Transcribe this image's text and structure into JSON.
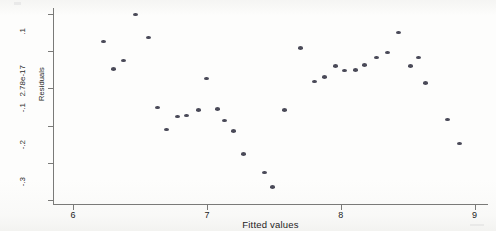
{
  "chart_data": {
    "type": "scatter",
    "title": "",
    "xlabel": "Fitted values",
    "ylabel": "Residuals",
    "xlim": [
      5.85,
      9.1
    ],
    "ylim": [
      -0.31,
      0.215
    ],
    "grid": false,
    "legend": null,
    "xticks": [
      {
        "value": 6,
        "label": "6"
      },
      {
        "value": 7,
        "label": "7"
      },
      {
        "value": 8,
        "label": "8"
      },
      {
        "value": 9,
        "label": "9"
      }
    ],
    "yticks": [
      {
        "value": 0.2,
        "label": ".2"
      },
      {
        "value": 0.1,
        "label": ".1"
      },
      {
        "value": 0.0,
        "label": "2.78e-17"
      },
      {
        "value": -0.1,
        "label": "-.1"
      },
      {
        "value": -0.2,
        "label": "-.2"
      },
      {
        "value": -0.3,
        "label": "-.3"
      }
    ],
    "marker": {
      "shape": "circle",
      "color": "#4a4a58",
      "size": 5
    },
    "points": [
      {
        "x": 6.23,
        "y": 0.125
      },
      {
        "x": 6.3,
        "y": 0.052
      },
      {
        "x": 6.38,
        "y": 0.075
      },
      {
        "x": 6.47,
        "y": 0.198
      },
      {
        "x": 6.56,
        "y": 0.136
      },
      {
        "x": 6.63,
        "y": -0.051
      },
      {
        "x": 6.7,
        "y": -0.111
      },
      {
        "x": 6.78,
        "y": -0.075
      },
      {
        "x": 6.85,
        "y": -0.073
      },
      {
        "x": 6.94,
        "y": -0.058
      },
      {
        "x": 7.0,
        "y": 0.026
      },
      {
        "x": 7.08,
        "y": -0.055
      },
      {
        "x": 7.13,
        "y": -0.086
      },
      {
        "x": 7.2,
        "y": -0.114
      },
      {
        "x": 7.27,
        "y": -0.176
      },
      {
        "x": 7.43,
        "y": -0.225
      },
      {
        "x": 7.49,
        "y": -0.264
      },
      {
        "x": 7.58,
        "y": -0.058
      },
      {
        "x": 7.7,
        "y": 0.108
      },
      {
        "x": 7.8,
        "y": 0.018
      },
      {
        "x": 7.88,
        "y": 0.03
      },
      {
        "x": 7.96,
        "y": 0.06
      },
      {
        "x": 8.03,
        "y": 0.048
      },
      {
        "x": 8.11,
        "y": 0.049
      },
      {
        "x": 8.18,
        "y": 0.062
      },
      {
        "x": 8.27,
        "y": 0.082
      },
      {
        "x": 8.35,
        "y": 0.096
      },
      {
        "x": 8.43,
        "y": 0.15
      },
      {
        "x": 8.52,
        "y": 0.06
      },
      {
        "x": 8.58,
        "y": 0.082
      },
      {
        "x": 8.63,
        "y": 0.014
      },
      {
        "x": 8.8,
        "y": -0.083
      },
      {
        "x": 8.89,
        "y": -0.148
      }
    ]
  }
}
